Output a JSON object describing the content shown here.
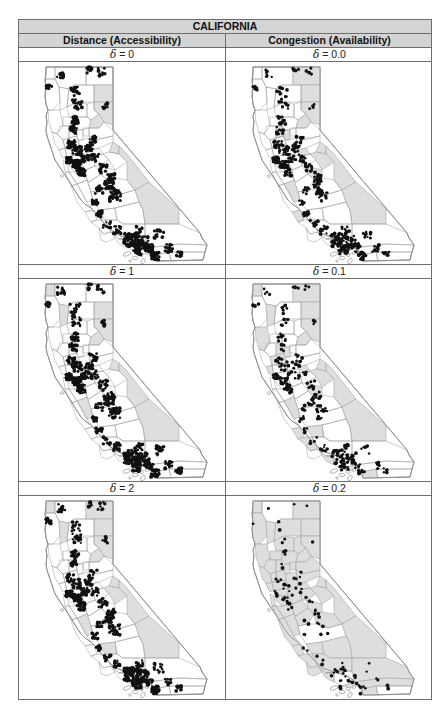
{
  "table": {
    "title": "CALIFORNIA",
    "columns": [
      {
        "label": "Distance (Accessibility)"
      },
      {
        "label": "Congestion (Availability)"
      }
    ],
    "rows": [
      {
        "left": {
          "symbol": "δ",
          "value": "= 0"
        },
        "right": {
          "symbol": "δ",
          "value": "= 0.0"
        }
      },
      {
        "left": {
          "symbol": "δ",
          "value": "= 1"
        },
        "right": {
          "symbol": "δ",
          "value": "= 0.1"
        }
      },
      {
        "left": {
          "symbol": "δ",
          "value": "= 2"
        },
        "right": {
          "symbol": "δ",
          "value": "= 0.2"
        }
      }
    ]
  },
  "colors": {
    "header_fill": "#d4d4d4",
    "shaded_county": "#dedede",
    "dot": "#111111",
    "border": "#6e6e6e"
  },
  "maps": [
    {
      "id": "dist-0",
      "shaded": [
        "modoc-east",
        "lassen",
        "sierra",
        "alpine",
        "mono",
        "inyo"
      ],
      "density": 1.0
    },
    {
      "id": "cong-0.0",
      "shaded": [
        "modoc",
        "modoc-east",
        "lassen",
        "sierra",
        "alpine",
        "mono",
        "inyo",
        "colusa",
        "sutter",
        "amador",
        "sanbenito",
        "montereyS",
        "mariposa",
        "tuolumne"
      ],
      "density": 0.6
    },
    {
      "id": "dist-1",
      "shaded": [
        "delnorte",
        "trinity",
        "modoc-east",
        "lassen",
        "sierra",
        "alpine",
        "mono",
        "inyo",
        "sanbenito"
      ],
      "density": 0.9
    },
    {
      "id": "cong-0.1",
      "shaded": [
        "delnorte",
        "trinity",
        "modoc",
        "modoc-east",
        "lassen",
        "sierra",
        "alpine",
        "mono",
        "inyo",
        "colusa",
        "sutter",
        "amador",
        "sanbenito",
        "montereyS",
        "mariposa",
        "tuolumne",
        "kings",
        "slo",
        "ventura",
        "orange",
        "sandiego",
        "yolo",
        "napa",
        "marin",
        "mendocino"
      ],
      "density": 0.35
    },
    {
      "id": "dist-2",
      "shaded": [
        "delnorte",
        "trinity",
        "modoc",
        "modoc-east",
        "lassen",
        "sierra",
        "alpine",
        "mono",
        "inyo",
        "sanbenito",
        "kings",
        "tuolumne"
      ],
      "density": 0.8
    },
    {
      "id": "cong-0.2",
      "shaded": [
        "delnorte",
        "trinity",
        "modoc",
        "modoc-east",
        "lassen",
        "sierra",
        "alpine",
        "mono",
        "inyo",
        "colusa",
        "sutter",
        "amador",
        "sanbenito",
        "montereyS",
        "mariposa",
        "tuolumne",
        "kings",
        "slo",
        "ventura",
        "orange",
        "sandiego",
        "yolo",
        "napa",
        "marin",
        "mendocino",
        "humboldt",
        "shasta",
        "tehama",
        "glenn",
        "butte",
        "plumas",
        "yuba",
        "placer",
        "eldorado",
        "sacramento",
        "sanjoaquin",
        "stanislaus",
        "merced",
        "calaveras",
        "santaclara",
        "monterey",
        "sonoma",
        "lake",
        "solano",
        "contracosta",
        "alameda",
        "santacruz",
        "sanmateo",
        "santabarbara",
        "madera",
        "tulare",
        "kern",
        "sanbernardino",
        "riverside-w"
      ],
      "density": 0.12
    }
  ]
}
